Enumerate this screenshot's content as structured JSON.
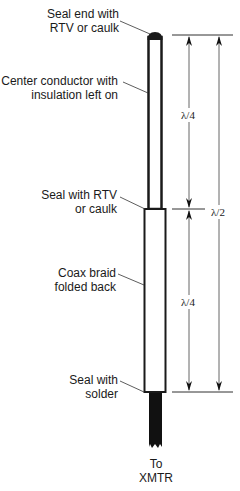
{
  "diagram": {
    "type": "antenna-construction",
    "labels": {
      "seal_end": [
        "Seal end with",
        "RTV or caulk"
      ],
      "center_conductor": [
        "Center conductor with",
        "insulation left on"
      ],
      "seal_rtv": [
        "Seal with RTV",
        "or caulk"
      ],
      "coax_braid": [
        "Coax braid",
        "folded back"
      ],
      "seal_solder": [
        "Seal with",
        "solder"
      ],
      "to_xmtr": [
        "To",
        "XMTR"
      ]
    },
    "dimensions": {
      "upper_section": "λ/4",
      "lower_section": "λ/4",
      "total": "λ/2"
    },
    "colors": {
      "line": "#1a1a1a",
      "dimension_line": "#555555",
      "background": "#ffffff"
    }
  }
}
